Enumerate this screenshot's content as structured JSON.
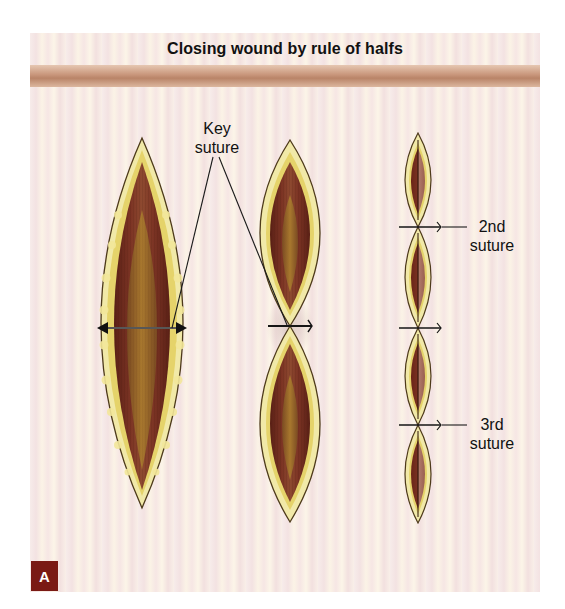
{
  "figure": {
    "title": "Closing wound by rule of halfs",
    "panel_label": "A",
    "labels": {
      "key_suture": [
        "Key",
        "suture"
      ],
      "second_suture": [
        "2nd",
        "suture"
      ],
      "third_suture": [
        "3rd",
        "suture"
      ]
    },
    "stages": [
      {
        "name": "open-wound",
        "description": "Full-length elliptical wound with width measurement arrow"
      },
      {
        "name": "key-suture-placed",
        "description": "Wound halved by key suture at midpoint"
      },
      {
        "name": "further-halving",
        "description": "Each half halved again by 2nd and 3rd sutures"
      }
    ],
    "colors": {
      "skin_rim": "#efe6a2",
      "fat_edge": "#e3d46e",
      "muscle": "#6e2b1f",
      "deep_fat": "#9a6a2e",
      "header_band": "#c8957a",
      "badge": "#7a1a14",
      "background_a": "#f7ecea",
      "background_b": "#fbf3e6"
    }
  }
}
